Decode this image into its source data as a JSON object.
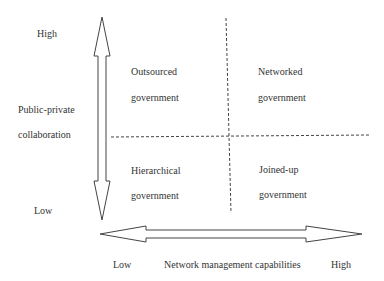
{
  "diagram": {
    "type": "2x2-matrix",
    "y_axis": {
      "title_line1": "Public-private",
      "title_line2": "collaboration",
      "high": "High",
      "low": "Low"
    },
    "x_axis": {
      "title": "Network management capabilities",
      "low": "Low",
      "high": "High"
    },
    "quadrants": {
      "top_left": {
        "line1": "Outsourced",
        "line2": "government"
      },
      "top_right": {
        "line1": "Networked",
        "line2": "government"
      },
      "bottom_left": {
        "line1": "Hierarchical",
        "line2": "government"
      },
      "bottom_right": {
        "line1": "Joined-up",
        "line2": "government"
      }
    },
    "colors": {
      "line": "#444444",
      "text": "#333333",
      "background": "#ffffff"
    }
  }
}
